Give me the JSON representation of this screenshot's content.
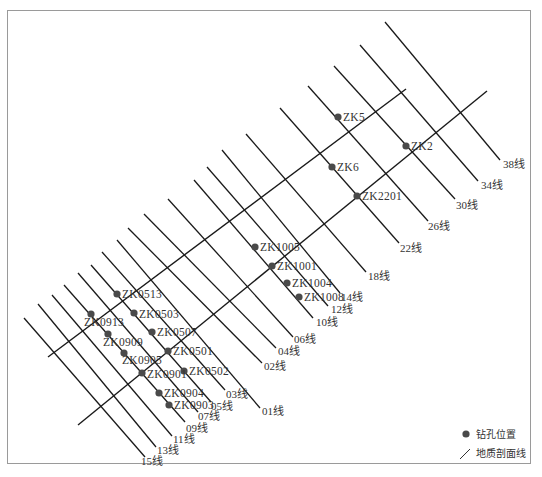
{
  "legend": {
    "borehole_label": "钻孔位置",
    "section_line_label": "地质剖面线"
  },
  "section_lines": [
    {
      "label": "38线",
      "x1": 385,
      "y1": 22,
      "x2": 500,
      "y2": 160,
      "lx": 503,
      "ly": 168
    },
    {
      "label": "34线",
      "x1": 360,
      "y1": 45,
      "x2": 478,
      "y2": 181,
      "lx": 481,
      "ly": 189
    },
    {
      "label": "30线",
      "x1": 334,
      "y1": 66,
      "x2": 455,
      "y2": 199,
      "lx": 456,
      "ly": 209
    },
    {
      "label": "26线",
      "x1": 308,
      "y1": 86,
      "x2": 428,
      "y2": 221,
      "lx": 428,
      "ly": 230
    },
    {
      "label": "22线",
      "x1": 280,
      "y1": 108,
      "x2": 399,
      "y2": 243,
      "lx": 400,
      "ly": 252
    },
    {
      "label": "18线",
      "x1": 246,
      "y1": 134,
      "x2": 366,
      "y2": 272,
      "lx": 368,
      "ly": 280
    },
    {
      "label": "14线",
      "x1": 222,
      "y1": 150,
      "x2": 340,
      "y2": 293,
      "lx": 341,
      "ly": 301
    },
    {
      "label": "12线",
      "x1": 207,
      "y1": 167,
      "x2": 328,
      "y2": 306,
      "lx": 331,
      "ly": 313
    },
    {
      "label": "10线",
      "x1": 194,
      "y1": 180,
      "x2": 313,
      "y2": 318,
      "lx": 316,
      "ly": 326
    },
    {
      "label": "06线",
      "x1": 168,
      "y1": 199,
      "x2": 293,
      "y2": 337,
      "lx": 294,
      "ly": 343
    },
    {
      "label": "04线",
      "x1": 144,
      "y1": 214,
      "x2": 276,
      "y2": 348,
      "lx": 278,
      "ly": 355
    },
    {
      "label": "02线",
      "x1": 128,
      "y1": 228,
      "x2": 262,
      "y2": 363,
      "lx": 264,
      "ly": 370
    },
    {
      "label": "01线",
      "x1": 117,
      "y1": 240,
      "x2": 260,
      "y2": 408,
      "lx": 262,
      "ly": 415
    },
    {
      "label": "03线",
      "x1": 102,
      "y1": 252,
      "x2": 225,
      "y2": 390,
      "lx": 226,
      "ly": 398
    },
    {
      "label": "05线",
      "x1": 91,
      "y1": 265,
      "x2": 211,
      "y2": 402,
      "lx": 211,
      "ly": 410
    },
    {
      "label": "07线",
      "x1": 78,
      "y1": 273,
      "x2": 198,
      "y2": 412,
      "lx": 198,
      "ly": 420
    },
    {
      "label": "09线",
      "x1": 64,
      "y1": 285,
      "x2": 185,
      "y2": 422,
      "lx": 186,
      "ly": 432
    },
    {
      "label": "11线",
      "x1": 52,
      "y1": 295,
      "x2": 172,
      "y2": 436,
      "lx": 173,
      "ly": 443
    },
    {
      "label": "13线",
      "x1": 38,
      "y1": 304,
      "x2": 156,
      "y2": 447,
      "lx": 157,
      "ly": 454
    },
    {
      "label": "15线",
      "x1": 24,
      "y1": 318,
      "x2": 145,
      "y2": 457,
      "lx": 141,
      "ly": 465
    }
  ],
  "base_lines": [
    {
      "name": "upper-baseline",
      "x1": 48,
      "y1": 357,
      "x2": 406,
      "y2": 89
    },
    {
      "name": "lower-baseline",
      "x1": 78,
      "y1": 425,
      "x2": 487,
      "y2": 91
    }
  ],
  "boreholes": [
    {
      "id": "ZK5",
      "x": 338,
      "y": 117,
      "lx": 343,
      "ly": 121
    },
    {
      "id": "ZK2",
      "x": 406,
      "y": 146,
      "lx": 411,
      "ly": 150
    },
    {
      "id": "ZK6",
      "x": 332,
      "y": 167,
      "lx": 337,
      "ly": 171
    },
    {
      "id": "ZK2201",
      "x": 357,
      "y": 196,
      "lx": 362,
      "ly": 200
    },
    {
      "id": "ZK1005",
      "x": 255,
      "y": 247,
      "lx": 260,
      "ly": 251
    },
    {
      "id": "ZK1001",
      "x": 272,
      "y": 266,
      "lx": 277,
      "ly": 270
    },
    {
      "id": "ZK1004",
      "x": 287,
      "y": 283,
      "lx": 292,
      "ly": 287
    },
    {
      "id": "ZK1008",
      "x": 299,
      "y": 297,
      "lx": 304,
      "ly": 301
    },
    {
      "id": "ZK0513",
      "x": 117,
      "y": 294,
      "lx": 122,
      "ly": 298
    },
    {
      "id": "ZK0503",
      "x": 134,
      "y": 313,
      "lx": 139,
      "ly": 318
    },
    {
      "id": "ZK0913",
      "x": 91,
      "y": 314,
      "lx": 84,
      "ly": 326
    },
    {
      "id": "ZK0507",
      "x": 152,
      "y": 332,
      "lx": 157,
      "ly": 336
    },
    {
      "id": "ZK0909",
      "x": 108,
      "y": 334,
      "lx": 103,
      "ly": 346
    },
    {
      "id": "ZK0501",
      "x": 168,
      "y": 351,
      "lx": 173,
      "ly": 355
    },
    {
      "id": "ZK0905",
      "x": 124,
      "y": 353,
      "lx": 122,
      "ly": 364
    },
    {
      "id": "ZK0502",
      "x": 184,
      "y": 371,
      "lx": 189,
      "ly": 375
    },
    {
      "id": "ZK0901",
      "x": 142,
      "y": 373,
      "lx": 147,
      "ly": 378
    },
    {
      "id": "ZK0904",
      "x": 159,
      "y": 393,
      "lx": 164,
      "ly": 397
    },
    {
      "id": "ZK0903",
      "x": 169,
      "y": 405,
      "lx": 174,
      "ly": 409
    }
  ],
  "colors": {
    "line": "#1a1a1a",
    "dot": "#4a4a4a",
    "text": "#333333",
    "border": "#9a9a9a"
  }
}
